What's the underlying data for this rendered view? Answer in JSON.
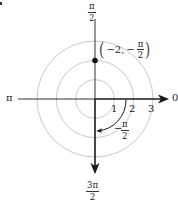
{
  "diagram": {
    "center": [
      95,
      99
    ],
    "unit_px": 19.3,
    "colors": {
      "axis": "#1a1a1a",
      "circle": "#c8c8c8",
      "point": "#111111",
      "text": "#222222"
    },
    "circles": [
      1,
      2,
      3
    ],
    "radial_tick_labels": [
      "1",
      "2",
      "3"
    ],
    "angle_labels": {
      "right": "0",
      "left": "π",
      "top": {
        "numerator": "π",
        "denominator": "2"
      },
      "bottom": {
        "numerator": "3π",
        "denominator": "2"
      }
    },
    "point": {
      "r": -2,
      "theta_label": "−π/2",
      "label_prefix": "−2,",
      "label_theta_sign": "−",
      "label_theta": {
        "numerator": "π",
        "denominator": "2"
      },
      "open_paren": "(",
      "close_paren": ")"
    },
    "angle_arc": {
      "label_sign": "−",
      "label": {
        "numerator": "π",
        "denominator": "2"
      }
    }
  }
}
